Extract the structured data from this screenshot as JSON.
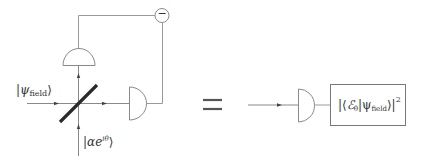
{
  "diagram": {
    "left": {
      "input_state_label": {
        "prefix": "|",
        "symbol": "ψ",
        "sub": "field",
        "suffix": "⟩"
      },
      "local_oscillator_label": {
        "prefix": "|",
        "symbol": "αe",
        "sup": "iθ",
        "suffix": "⟩"
      },
      "subtractor_symbol": "−",
      "components": [
        "beamsplitter",
        "detector-top",
        "detector-right",
        "subtractor"
      ]
    },
    "equals_symbol": "=",
    "right": {
      "components": [
        "detector",
        "result-box"
      ],
      "result": {
        "open": "|⟨",
        "E": "ℰ",
        "E_sub": "θ",
        "mid": "|ψ",
        "psi_sub": "field",
        "close": "⟩|",
        "power": "2"
      }
    },
    "colors": {
      "wire": "#9a9a9a",
      "beamsplitter": "#2a2a2a",
      "text": "#333333",
      "background": "#ffffff"
    }
  }
}
